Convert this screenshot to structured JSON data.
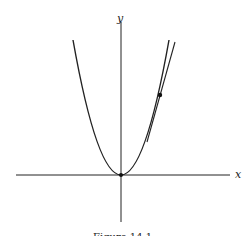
{
  "figure": {
    "caption": "Figure 14.1",
    "x_axis_label": "x",
    "y_axis_label": "y",
    "curve": "parabola y = x^2",
    "tangent_point": "point on right branch with tangent line"
  },
  "colors": {
    "stroke": "#222222",
    "background": "#ffffff"
  }
}
